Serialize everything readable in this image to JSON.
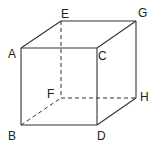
{
  "diagram": {
    "type": "cube",
    "stroke_color": "#333333",
    "vertices": {
      "A": {
        "x": 21,
        "y": 48,
        "label": "A"
      },
      "B": {
        "x": 21,
        "y": 125,
        "label": "B"
      },
      "C": {
        "x": 97,
        "y": 48,
        "label": "C"
      },
      "D": {
        "x": 97,
        "y": 125,
        "label": "D"
      },
      "E": {
        "x": 61,
        "y": 21,
        "label": "E"
      },
      "F": {
        "x": 61,
        "y": 98,
        "label": "F"
      },
      "G": {
        "x": 136,
        "y": 21,
        "label": "G"
      },
      "H": {
        "x": 136,
        "y": 98,
        "label": "H"
      }
    },
    "solid_edges": [
      "AC",
      "AB",
      "CD",
      "BD",
      "AE",
      "EG",
      "CG",
      "GH",
      "DH"
    ],
    "dashed_edges": [
      "EF",
      "FH",
      "BF"
    ]
  }
}
